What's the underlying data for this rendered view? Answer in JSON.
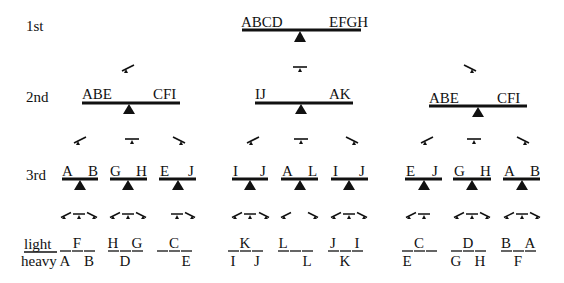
{
  "rows": {
    "first": "1st",
    "second": "2nd",
    "third": "3rd",
    "light": "light",
    "heavy": "heavy"
  },
  "weighing1": {
    "left": "ABCD",
    "right": "EFGH"
  },
  "weighing2": [
    {
      "left": "ABE",
      "right": "CFI"
    },
    {
      "left": "IJ",
      "right": "AK"
    },
    {
      "left": "ABE",
      "right": "CFI"
    }
  ],
  "weighing3": [
    {
      "left": "A",
      "right": "B"
    },
    {
      "left": "G",
      "right": "H"
    },
    {
      "left": "E",
      "right": "J"
    },
    {
      "left": "I",
      "right": "J"
    },
    {
      "left": "A",
      "right": "L"
    },
    {
      "left": "I",
      "right": "J"
    },
    {
      "left": "E",
      "right": "J"
    },
    {
      "left": "G",
      "right": "H"
    },
    {
      "left": "A",
      "right": "B"
    }
  ],
  "outcomes": [
    {
      "light": [
        "",
        "F",
        ""
      ],
      "heavy": [
        "A",
        "",
        "B"
      ]
    },
    {
      "light": [
        "H",
        "",
        "G"
      ],
      "heavy": [
        "",
        "D",
        ""
      ]
    },
    {
      "light": [
        "",
        "C",
        ""
      ],
      "heavy": [
        "",
        "",
        "E"
      ]
    },
    {
      "light": [
        "",
        "K",
        ""
      ],
      "heavy": [
        "I",
        "",
        "J"
      ]
    },
    {
      "light": [
        "L",
        "",
        ""
      ],
      "heavy": [
        "",
        "",
        "L"
      ]
    },
    {
      "light": [
        "J",
        "",
        "I"
      ],
      "heavy": [
        "",
        "K",
        ""
      ]
    },
    {
      "light": [
        "",
        "C",
        ""
      ],
      "heavy": [
        "E",
        "",
        ""
      ]
    },
    {
      "light": [
        "",
        "D",
        ""
      ],
      "heavy": [
        "G",
        "",
        "H"
      ]
    },
    {
      "light": [
        "B",
        "",
        "A"
      ],
      "heavy": [
        "",
        "F",
        ""
      ]
    }
  ]
}
